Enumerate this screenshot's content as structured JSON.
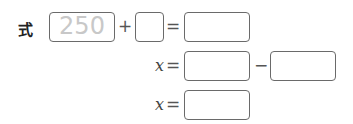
{
  "expression": {
    "label": "式",
    "row1": {
      "term1_value": "250",
      "plus": "+",
      "term2_value": "",
      "equals": "=",
      "result_value": ""
    },
    "row2": {
      "variable": "x",
      "equals": "=",
      "term1_value": "",
      "minus": "−",
      "term2_value": ""
    },
    "row3": {
      "variable": "x",
      "equals": "=",
      "answer_value": ""
    }
  }
}
